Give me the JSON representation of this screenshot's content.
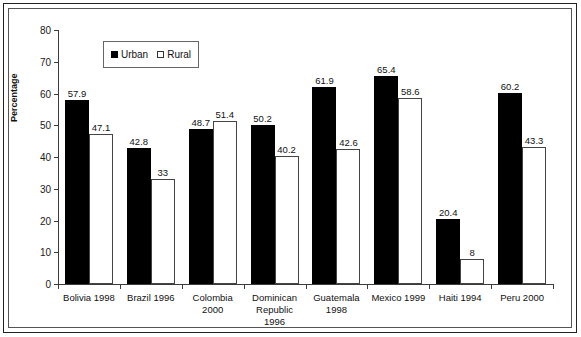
{
  "chart_data": {
    "type": "bar",
    "title": "",
    "xlabel": "",
    "ylabel": "Percentage",
    "ylim": [
      0,
      80
    ],
    "yticks": [
      0,
      10,
      20,
      30,
      40,
      50,
      60,
      70,
      80
    ],
    "ytick_labels": [
      "0",
      "10",
      "20",
      "30",
      "40",
      "50",
      "60",
      "70",
      "80"
    ],
    "grid": false,
    "legend_position": "upper-left-inside",
    "categories": [
      "Bolivia 1998",
      "Brazil 1996",
      "Colombia 2000",
      "Dominican Republic 1996",
      "Guatemala 1998",
      "Mexico 1999",
      "Haiti 1994",
      "Peru 2000"
    ],
    "category_lines": [
      [
        "Bolivia 1998"
      ],
      [
        "Brazil 1996"
      ],
      [
        "Colombia",
        "2000"
      ],
      [
        "Dominican",
        "Republic",
        "1996"
      ],
      [
        "Guatemala",
        "1998"
      ],
      [
        "Mexico 1999"
      ],
      [
        "Haiti 1994"
      ],
      [
        "Peru 2000"
      ]
    ],
    "series": [
      {
        "name": "Urban",
        "color": "#000000",
        "values": [
          57.9,
          42.8,
          48.7,
          50.2,
          61.9,
          65.4,
          20.4,
          60.2
        ],
        "labels": [
          "57.9",
          "42.8",
          "48.7",
          "50.2",
          "61.9",
          "65.4",
          "20.4",
          "60.2"
        ]
      },
      {
        "name": "Rural",
        "color": "#ffffff",
        "values": [
          47.1,
          33,
          51.4,
          40.2,
          42.6,
          58.6,
          8,
          43.3
        ],
        "labels": [
          "47.1",
          "33",
          "51.4",
          "40.2",
          "42.6",
          "58.6",
          "8",
          "43.3"
        ]
      }
    ]
  },
  "legend": {
    "entries": [
      {
        "label": "Urban",
        "marker": "filled-square-icon"
      },
      {
        "label": "Rural",
        "marker": "open-square-icon"
      }
    ]
  }
}
